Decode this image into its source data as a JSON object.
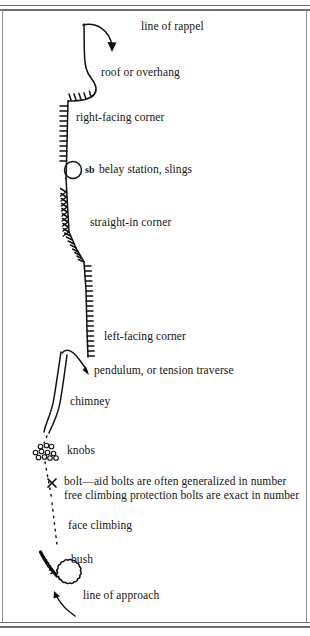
{
  "document": {
    "kind": "climbing-topo-symbol-legend",
    "ink_color": "#111111",
    "paper_color": "#ffffff",
    "rule_color": "#6d6d6d"
  },
  "labels": {
    "line_of_rappel": "line of rappel",
    "roof_or_overhang": "roof or overhang",
    "right_facing_corner": "right-facing corner",
    "belay_marker": "sb",
    "belay_station_slings": "belay station, slings",
    "straight_in_corner": "straight-in corner",
    "left_facing_corner": "left-facing corner",
    "pendulum_or_tension_traverse": "pendulum, or tension traverse",
    "chimney": "chimney",
    "knobs": "knobs",
    "bolt_aid_line": "bolt—aid bolts are often generalized in number",
    "bolt_free_line": "free climbing protection bolts are exact in number",
    "face_climbing": "face climbing",
    "bush": "bush",
    "line_of_approach": "line of approach"
  },
  "symbols": [
    {
      "name": "rappel-arrow",
      "label_key": "line_of_rappel"
    },
    {
      "name": "roof-overhang-bulge",
      "label_key": "roof_or_overhang"
    },
    {
      "name": "right-facing-corner-ticks",
      "label_key": "right_facing_corner"
    },
    {
      "name": "belay-station-circle",
      "label_key": "belay_station_slings"
    },
    {
      "name": "straight-in-corner-ticks",
      "label_key": "straight_in_corner"
    },
    {
      "name": "left-facing-corner-ticks",
      "label_key": "left_facing_corner"
    },
    {
      "name": "pendulum-arrow",
      "label_key": "pendulum_or_tension_traverse"
    },
    {
      "name": "chimney-double-line",
      "label_key": "chimney"
    },
    {
      "name": "knobs-circle-cluster",
      "label_key": "knobs"
    },
    {
      "name": "bolt-x-mark",
      "label_key": "bolt_aid_line"
    },
    {
      "name": "face-climbing-dotted-line",
      "label_key": "face_climbing"
    },
    {
      "name": "bush-scalloped-circle",
      "label_key": "bush"
    },
    {
      "name": "approach-arrow",
      "label_key": "line_of_approach"
    }
  ]
}
